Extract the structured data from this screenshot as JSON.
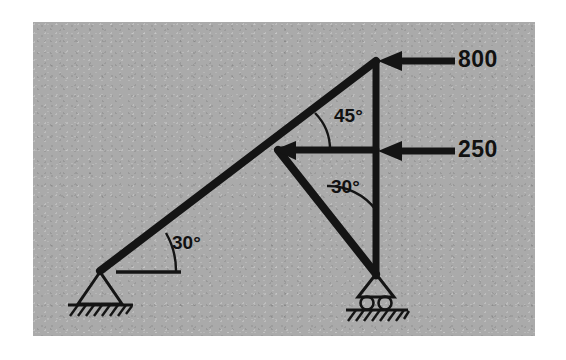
{
  "figure": {
    "kind": "truss-free-body-diagram",
    "panel_background_color": "#aaaaaa",
    "page_background_color": "#ffffff",
    "member_color": "#141414",
    "label_color": "#111111"
  },
  "loads": [
    {
      "id": "load-top",
      "value": "800",
      "direction": "left",
      "applied_at": "apex-joint",
      "arrow": {
        "tail_x": 455,
        "tip_x": 379,
        "y": 61
      }
    },
    {
      "id": "load-middle",
      "value": "250",
      "direction": "left",
      "applied_at": "right-mid-joint",
      "arrow": {
        "tail_x": 455,
        "tip_x": 379,
        "y": 151
      }
    }
  ],
  "angles": [
    {
      "id": "angle-apex",
      "value": "45°",
      "between": "top-chord and horizontal-member",
      "vertex": "center-joint"
    },
    {
      "id": "angle-web",
      "value": "30°",
      "between": "lower-diagonal and vertical-member",
      "vertex": "center-joint"
    },
    {
      "id": "angle-base",
      "value": "30°",
      "between": "long-diagonal and ground-reference-line",
      "vertex": "pin-support-joint"
    }
  ],
  "joints": [
    {
      "id": "apex-joint",
      "x": 376,
      "y": 61
    },
    {
      "id": "center-joint",
      "x": 278,
      "y": 150
    },
    {
      "id": "right-mid-joint",
      "x": 376,
      "y": 150
    },
    {
      "id": "roller-joint",
      "x": 376,
      "y": 274
    },
    {
      "id": "pin-joint",
      "x": 100,
      "y": 271
    }
  ],
  "members": [
    {
      "id": "long-diagonal",
      "from": "pin-joint",
      "to": "apex-joint"
    },
    {
      "id": "vertical-member",
      "from": "apex-joint",
      "to": "roller-joint"
    },
    {
      "id": "horizontal-member",
      "from": "center-joint",
      "to": "right-mid-joint"
    },
    {
      "id": "lower-diagonal",
      "from": "center-joint",
      "to": "roller-joint"
    }
  ],
  "supports": [
    {
      "id": "pin-support",
      "type": "pin",
      "x": 100,
      "y": 271,
      "label": "pinned support"
    },
    {
      "id": "roller-support",
      "type": "roller",
      "x": 376,
      "y": 274,
      "label": "roller support"
    }
  ],
  "reference_line": {
    "id": "ground-reference-line",
    "x1": 118,
    "x2": 180,
    "y": 272
  }
}
